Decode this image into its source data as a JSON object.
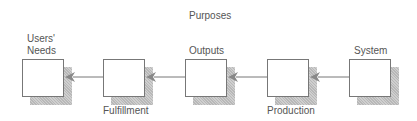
{
  "diagram": {
    "title": "Purposes",
    "nodes": [
      {
        "id": "users-needs",
        "label_top": "Users'",
        "label_bottom": "Needs",
        "x": 22
      },
      {
        "id": "fulfillment",
        "label": "Fulfillment",
        "x": 103
      },
      {
        "id": "outputs",
        "label": "Outputs",
        "x": 185
      },
      {
        "id": "production",
        "label": "Production",
        "x": 267
      },
      {
        "id": "system",
        "label": "System",
        "x": 349
      }
    ],
    "edges": [
      {
        "from": "system",
        "to": "production"
      },
      {
        "from": "production",
        "to": "outputs"
      },
      {
        "from": "outputs",
        "to": "fulfillment"
      },
      {
        "from": "fulfillment",
        "to": "users-needs"
      }
    ],
    "colors": {
      "line": "#777777",
      "shadow": "#c4c4c4",
      "text": "#555555"
    }
  }
}
